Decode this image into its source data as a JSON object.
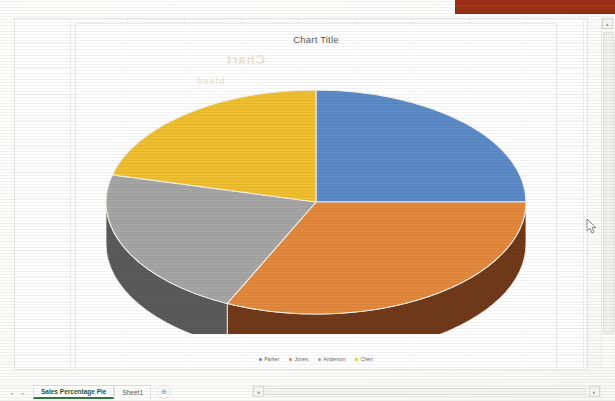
{
  "window": {
    "accent_red": "#9c2d16"
  },
  "chart": {
    "title": "Chart Title"
  },
  "chart_data": {
    "type": "pie",
    "title": "Chart Title",
    "subtitle": "",
    "xlabel": "",
    "ylabel": "",
    "three_d": true,
    "legend_position": "bottom",
    "grid": false,
    "categories": [
      "Parker",
      "Jones",
      "Anderson",
      "Chen"
    ],
    "values": [
      25,
      32,
      22,
      21
    ],
    "units": "percent",
    "colors": [
      "#5B8AC6",
      "#E2883C",
      "#A5A5A5",
      "#EFBF2F"
    ],
    "side_colors": [
      "#3C5F8C",
      "#70391A",
      "#5A5A5A",
      "#A98319"
    ],
    "slices": [
      {
        "label": "Parker",
        "value": 25,
        "color": "#5B8AC6",
        "start_angle": 0,
        "end_angle": 90
      },
      {
        "label": "Jones",
        "value": 32,
        "color": "#E2883C",
        "start_angle": 90,
        "end_angle": 205
      },
      {
        "label": "Anderson",
        "value": 22,
        "color": "#A5A5A5",
        "start_angle": 205,
        "end_angle": 284
      },
      {
        "label": "Chen",
        "value": 21,
        "color": "#EFBF2F",
        "start_angle": 284,
        "end_angle": 360
      }
    ]
  },
  "legend": {
    "items": [
      {
        "label": "Parker",
        "color": "#5B8AC6"
      },
      {
        "label": "Jones",
        "color": "#E2883C"
      },
      {
        "label": "Anderson",
        "color": "#A5A5A5"
      },
      {
        "label": "Chen",
        "color": "#EFBF2F"
      }
    ]
  },
  "sheet_tabs": {
    "nav_first": "◂",
    "nav_prev": "◂",
    "nav_next": "▸",
    "tabs": [
      {
        "label": "Sales Percentage Pie",
        "active": true
      },
      {
        "label": "Sheet1",
        "active": false
      }
    ],
    "add_sheet_label": "⊕"
  },
  "scrollbars": {
    "v_up_label": "▴",
    "h_left_label": "◂",
    "h_right_label": "▸"
  },
  "cursor": {
    "name": "arrow-pointer"
  }
}
